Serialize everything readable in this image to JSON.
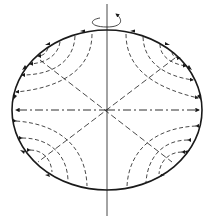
{
  "diagram": {
    "title": "",
    "colors": {
      "line": "#1a1a1a",
      "background": "#ffffff"
    },
    "ellipse": {
      "cx": 107,
      "cy": 110,
      "rx": 95,
      "ry": 80
    },
    "rotation_axis": {
      "x": 107,
      "y1": 4,
      "y2": 216,
      "rotation_arrow": "counterclockwise-around-axis"
    },
    "diagonals": [
      "upper-left to lower-right",
      "upper-right to lower-left"
    ],
    "equator": {
      "style": "dash-dot",
      "arrows": "outward both ends"
    }
  }
}
